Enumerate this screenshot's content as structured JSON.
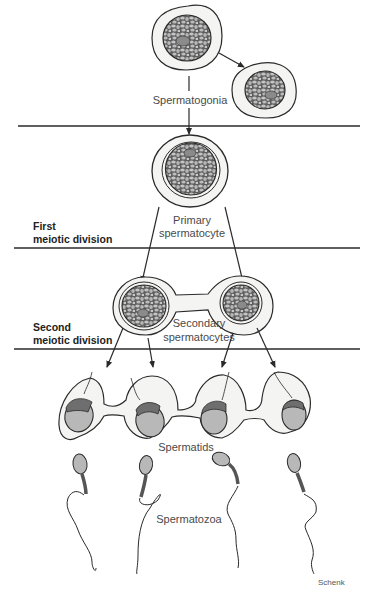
{
  "diagram": {
    "stages": [
      {
        "id": "spermatogonia",
        "label": "Spermatogonia"
      },
      {
        "id": "primary",
        "label_line1": "Primary",
        "label_line2": "spermatocyte"
      },
      {
        "id": "secondary",
        "label_line1": "Secondary",
        "label_line2": "spermatocytes"
      },
      {
        "id": "spermatids",
        "label": "Spermatids"
      },
      {
        "id": "spermatozoa",
        "label": "Spermatozoa"
      }
    ],
    "phases": [
      {
        "line1": "First",
        "line2": "meiotic division"
      },
      {
        "line1": "Second",
        "line2": "meiotic division"
      }
    ],
    "credit": "Schenk",
    "colors": {
      "line": "#2a2a2a",
      "cytoplasm": "#f4f4f2",
      "nucleus_bg": "#6e6e6e",
      "chromatin": "#bdbdbd",
      "nucleolus": "#8a8a8a",
      "head": "#b8b8b8",
      "acrosome_cap": "#7a7a7a",
      "midpiece": "#555555"
    }
  }
}
